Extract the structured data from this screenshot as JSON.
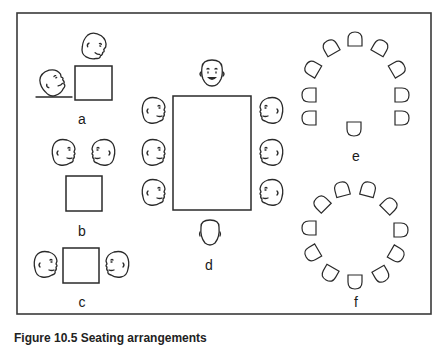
{
  "figure": {
    "caption": "Figure 10.5 Seating arrangements",
    "panels": [
      {
        "id": "a",
        "label": "a",
        "description": "two people at a square table, seated at adjacent (corner) sides",
        "people": 2
      },
      {
        "id": "b",
        "label": "b",
        "description": "two people side by side on the same side of a square table",
        "people": 2
      },
      {
        "id": "c",
        "label": "c",
        "description": "two people facing each other across a square table",
        "people": 2
      },
      {
        "id": "d",
        "label": "d",
        "description": "rectangular table with one person at head, one at foot, three on each side",
        "people": 8
      },
      {
        "id": "e",
        "label": "e",
        "description": "U-shaped / horseshoe arrangement of seats with one seat at the open end",
        "seats": 10
      },
      {
        "id": "f",
        "label": "f",
        "description": "circular arrangement of seats",
        "seats": 12
      }
    ]
  },
  "colors": {
    "stroke": "#2a2a2a",
    "background": "#ffffff",
    "frame": "#3a3a3a"
  }
}
